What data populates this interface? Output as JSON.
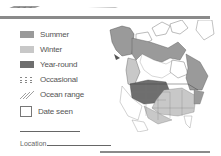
{
  "legend": {
    "items": [
      {
        "key": "summer",
        "label": "Summer",
        "color": "#9a9a9a"
      },
      {
        "key": "winter",
        "label": "Winter",
        "color": "#c8c8c8"
      },
      {
        "key": "yearround",
        "label": "Year-round",
        "color": "#6e6e6e"
      },
      {
        "key": "occasional",
        "label": "Occasional",
        "icon": "dotted-grid-icon"
      },
      {
        "key": "ocean",
        "label": "Ocean range",
        "icon": "diagonal-hatch-icon"
      }
    ],
    "date_seen": {
      "label": "Date seen"
    }
  },
  "fields": {
    "location_label": "Location"
  },
  "map": {
    "region": "North America range map"
  }
}
